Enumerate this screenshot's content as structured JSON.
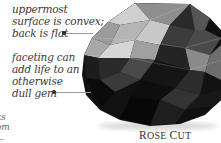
{
  "annotations": [
    {
      "id": "convex",
      "lines": [
        "uppermost",
        "surface is convex;",
        "back is flat"
      ]
    },
    {
      "id": "faceting",
      "lines": [
        "faceting can",
        "add life to an",
        "otherwise",
        "dull gem"
      ]
    },
    {
      "id": "cut-off",
      "lines": [
        "ks",
        "om",
        "..."
      ]
    }
  ],
  "caption": {
    "first_initial": "R",
    "first_rest": "OSE",
    "second_initial": "C",
    "second_rest": "UT"
  },
  "colors": {
    "light_facet": "#bdbdbd",
    "mid_facet": "#7a7a7a",
    "dark_facet": "#1a1a1a",
    "black": "#0a0a0a",
    "leader_line": "#9a9a9a"
  }
}
